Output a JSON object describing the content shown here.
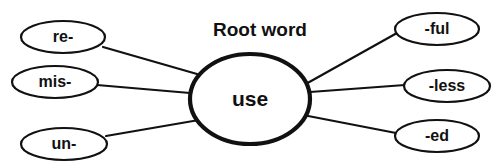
{
  "diagram": {
    "title": "Root word",
    "type": "word-web",
    "colors": {
      "stroke": "#111111",
      "fill": "#ffffff",
      "background": "#ffffff"
    },
    "root": {
      "label": "use",
      "cx": 250,
      "cy": 99,
      "rx": 60,
      "ry": 45
    },
    "title_position": {
      "x": 260,
      "y": 36
    },
    "prefixes": [
      {
        "label": "re-",
        "cx": 63,
        "cy": 37,
        "rx": 42,
        "ry": 16,
        "line": {
          "x1": 103,
          "y1": 47,
          "x2": 197,
          "y2": 74
        }
      },
      {
        "label": "mis-",
        "cx": 55,
        "cy": 82,
        "rx": 43,
        "ry": 16,
        "line": {
          "x1": 97,
          "y1": 85,
          "x2": 190,
          "y2": 93
        }
      },
      {
        "label": "un-",
        "cx": 64,
        "cy": 144,
        "rx": 43,
        "ry": 16,
        "line": {
          "x1": 106,
          "y1": 136,
          "x2": 199,
          "y2": 120
        }
      }
    ],
    "suffixes": [
      {
        "label": "-ful",
        "cx": 437,
        "cy": 29,
        "rx": 42,
        "ry": 16,
        "line": {
          "x1": 397,
          "y1": 33,
          "x2": 304,
          "y2": 85
        }
      },
      {
        "label": "-less",
        "cx": 447,
        "cy": 86,
        "rx": 43,
        "ry": 16,
        "line": {
          "x1": 405,
          "y1": 85,
          "x2": 310,
          "y2": 92
        }
      },
      {
        "label": "-ed",
        "cx": 437,
        "cy": 136,
        "rx": 42,
        "ry": 16,
        "line": {
          "x1": 396,
          "y1": 133,
          "x2": 303,
          "y2": 115
        }
      }
    ]
  }
}
